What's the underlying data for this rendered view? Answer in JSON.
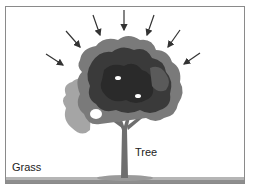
{
  "diagram": {
    "labels": {
      "tree": "Tree",
      "grass": "Grass"
    },
    "arrows_count": 7,
    "colors": {
      "frame": "#8a8a8a",
      "foliage_dark": "#2e2e2e",
      "foliage_mid": "#5a5a5a",
      "foliage_light": "#9a9a9a",
      "trunk": "#6e6e6e",
      "ground": "#9c9c9c",
      "arrow": "#333333"
    }
  }
}
